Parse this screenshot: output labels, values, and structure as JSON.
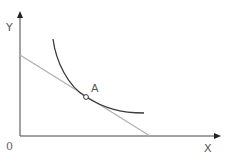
{
  "diagram": {
    "type": "indifference-curve-budget-line",
    "labels": {
      "y_axis": "Y",
      "x_axis": "X",
      "origin": "0",
      "point": "A"
    },
    "colors": {
      "axis": "#444444",
      "budget_line": "#b0b0b0",
      "indifference_curve": "#3a3a3a",
      "point_fill": "#ffffff",
      "point_stroke": "#3a3a3a",
      "text": "#555555"
    },
    "elements": [
      {
        "name": "y-axis",
        "description": "vertical axis with arrow"
      },
      {
        "name": "x-axis",
        "description": "horizontal axis with arrow"
      },
      {
        "name": "budget-line",
        "description": "straight light-gray line sloping downward from Y axis to X axis"
      },
      {
        "name": "indifference-curve",
        "description": "convex curve tangent to budget line at point A"
      },
      {
        "name": "tangency-point-A",
        "description": "open circle marking tangency point"
      }
    ]
  }
}
